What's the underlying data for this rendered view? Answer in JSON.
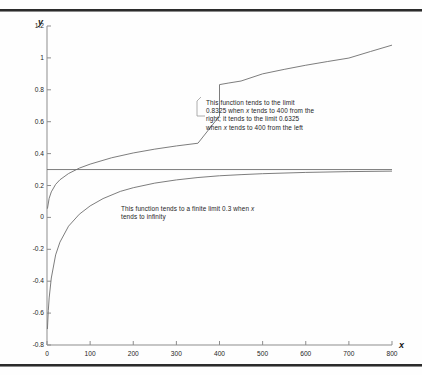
{
  "chart_data": {
    "type": "line",
    "title": "",
    "xlabel": "x",
    "ylabel": "y",
    "xlim": [
      0,
      800
    ],
    "ylim": [
      -0.8,
      1.2
    ],
    "xticks": [
      0,
      100,
      200,
      300,
      400,
      500,
      600,
      700,
      800
    ],
    "xtick_labels": [
      "0",
      "100",
      "200",
      "300",
      "400",
      "500",
      "600",
      "700",
      "800"
    ],
    "yticks": [
      -0.8,
      -0.6,
      -0.4,
      -0.2,
      0,
      0.2,
      0.4,
      0.6,
      0.8,
      1,
      1.2
    ],
    "ytick_labels": [
      "-0.8",
      "-0.6",
      "-0.4",
      "-0.2",
      "0",
      "0.2",
      "0.4",
      "0.6",
      "0.8",
      "1",
      "1.2"
    ],
    "grid": false,
    "legend": "none",
    "line_color": "#6e6e6e",
    "axis_color": "#8d8d8d",
    "series": [
      {
        "name": "discontinuous-function",
        "note": "log-like curve with jump discontinuity at x=400",
        "x": [
          1,
          5,
          10,
          20,
          30,
          50,
          75,
          100,
          150,
          200,
          250,
          300,
          350,
          399,
          400,
          420,
          450,
          500,
          550,
          600,
          650,
          700,
          750,
          800
        ],
        "y": [
          0.055,
          0.12,
          0.16,
          0.207,
          0.236,
          0.275,
          0.309,
          0.334,
          0.374,
          0.404,
          0.428,
          0.448,
          0.465,
          0.6325,
          0.8325,
          0.842,
          0.855,
          0.9,
          0.928,
          0.954,
          0.977,
          0.999,
          1.04,
          1.08
        ],
        "jump_x": 400,
        "left_limit": 0.6325,
        "right_limit": 0.8325
      },
      {
        "name": "finite-limit-function",
        "note": "rises from about -0.7 and tends to 0.3",
        "x": [
          1,
          3,
          5,
          10,
          20,
          30,
          50,
          75,
          100,
          130,
          170,
          200,
          250,
          300,
          350,
          400,
          450,
          500,
          600,
          700,
          800
        ],
        "y": [
          -0.7,
          -0.585,
          -0.505,
          -0.38,
          -0.235,
          -0.155,
          -0.055,
          0.02,
          0.072,
          0.118,
          0.163,
          0.186,
          0.215,
          0.235,
          0.25,
          0.261,
          0.268,
          0.274,
          0.282,
          0.287,
          0.29
        ],
        "limit": 0.3
      },
      {
        "name": "asymptote-line",
        "note": "horizontal limit line y = 0.3",
        "x": [
          0,
          800
        ],
        "y": [
          0.3,
          0.3
        ]
      }
    ],
    "annotations": [
      {
        "name": "jump-annotation",
        "text": "This function tends to the limit 0.8325 when x tends to 400 from the right; it tends to the limit 0.6325 when x tends to 400 from the left",
        "lines": [
          "This function tends to the limit",
          "0.8325 when x tends to 400 from the",
          "right; it tends to the limit 0.6325",
          "when x tends to 400 from the left"
        ],
        "points_to_x": 400,
        "points_to_y": 0.72
      },
      {
        "name": "limit-annotation",
        "text": "This function tends to a finite limit 0.3 when x tends to infinity",
        "lines": [
          "This function tends to a finite limit 0.3 when x",
          "tends to infinity"
        ],
        "points_to_x": 300,
        "points_to_y": 0.3
      }
    ]
  },
  "axis": {
    "y_title": "y",
    "x_title": "x"
  }
}
